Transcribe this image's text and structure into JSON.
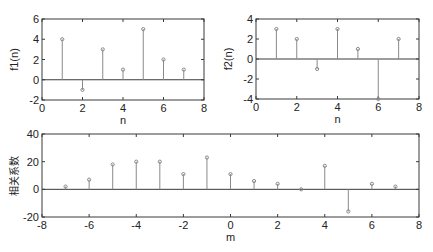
{
  "chart_data": [
    {
      "type": "stem",
      "id": "f1",
      "title": "",
      "xlabel": "n",
      "ylabel": "f1(n)",
      "xlim": [
        0,
        8
      ],
      "ylim": [
        -2,
        6
      ],
      "xticks": [
        0,
        2,
        4,
        6,
        8
      ],
      "yticks": [
        -2,
        0,
        2,
        4,
        6
      ],
      "grid": false,
      "x": [
        1,
        2,
        3,
        4,
        5,
        6,
        7
      ],
      "values": [
        4,
        -1,
        3,
        1,
        5,
        2,
        1
      ],
      "box": {
        "left": 42,
        "top": 19,
        "right": 204,
        "bottom": 100
      }
    },
    {
      "type": "stem",
      "id": "f2",
      "title": "",
      "xlabel": "n",
      "ylabel": "f2(n)",
      "xlim": [
        0,
        8
      ],
      "ylim": [
        -4,
        4
      ],
      "xticks": [
        0,
        2,
        4,
        6,
        8
      ],
      "yticks": [
        -4,
        -2,
        0,
        2,
        4
      ],
      "grid": false,
      "x": [
        1,
        2,
        3,
        4,
        5,
        6,
        7
      ],
      "values": [
        3,
        2,
        -1,
        3,
        1,
        -4,
        2
      ],
      "box": {
        "left": 256,
        "top": 19,
        "right": 419,
        "bottom": 99
      }
    },
    {
      "type": "stem",
      "id": "xcorr",
      "title": "",
      "xlabel": "m",
      "ylabel": "相关系数",
      "xlim": [
        -8,
        8
      ],
      "ylim": [
        -20,
        40
      ],
      "xticks": [
        -8,
        -6,
        -4,
        -2,
        0,
        2,
        4,
        6,
        8
      ],
      "yticks": [
        -20,
        0,
        20,
        40
      ],
      "grid": false,
      "x": [
        -7,
        -6,
        -5,
        -4,
        -3,
        -2,
        -1,
        0,
        1,
        2,
        3,
        4,
        5,
        6,
        7
      ],
      "values": [
        2,
        7,
        18,
        20,
        20,
        11,
        23,
        11,
        6,
        4,
        0,
        17,
        -16,
        4,
        2
      ],
      "box": {
        "left": 42,
        "top": 134,
        "right": 419,
        "bottom": 217
      }
    }
  ],
  "colors": {
    "stem": "#8a8a8a",
    "axis": "#3a3a3a",
    "text": "#222222",
    "background": "#ffffff"
  }
}
